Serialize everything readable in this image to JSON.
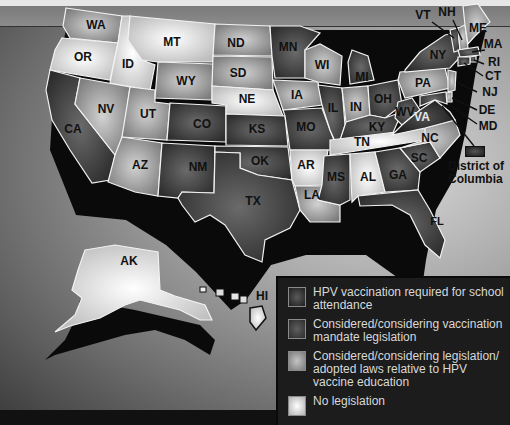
{
  "map": {
    "type": "choropleth",
    "subject": "HPV vaccination legislation status by US state",
    "colors": {
      "required": "#2a2a2a",
      "mandate_considered": "#4a4a4a",
      "education": "#a0a0a0",
      "none": "#f0f0f0",
      "border": "#f2f2f2",
      "legend_bg": "#1c1c1c"
    },
    "states": {
      "WA": "education",
      "OR": "none",
      "CA": "mandate_considered",
      "ID": "none",
      "NV": "education",
      "UT": "education",
      "AZ": "education",
      "MT": "none",
      "WY": "education",
      "CO": "mandate_considered",
      "NM": "mandate_considered",
      "ND": "education",
      "SD": "education",
      "NE": "none",
      "KS": "mandate_considered",
      "OK": "mandate_considered",
      "TX": "mandate_considered",
      "MN": "mandate_considered",
      "IA": "education",
      "MO": "mandate_considered",
      "AR": "none",
      "LA": "education",
      "WI": "education",
      "IL": "mandate_considered",
      "MI": "mandate_considered",
      "IN": "education",
      "OH": "mandate_considered",
      "KY": "mandate_considered",
      "TN": "none",
      "MS": "mandate_considered",
      "AL": "none",
      "GA": "mandate_considered",
      "FL": "mandate_considered",
      "SC": "mandate_considered",
      "NC": "education",
      "VA": "required",
      "WV": "mandate_considered",
      "PA": "education",
      "NY": "mandate_considered",
      "VT": "mandate_considered",
      "NH": "education",
      "ME": "education",
      "MA": "mandate_considered",
      "RI": "mandate_considered",
      "CT": "mandate_considered",
      "NJ": "education",
      "DE": "education",
      "MD": "mandate_considered",
      "DC": "required",
      "AK": "none",
      "HI": "none"
    },
    "labels": {
      "WA": "WA",
      "OR": "OR",
      "CA": "CA",
      "ID": "ID",
      "NV": "NV",
      "UT": "UT",
      "AZ": "AZ",
      "MT": "MT",
      "WY": "WY",
      "CO": "CO",
      "NM": "NM",
      "ND": "ND",
      "SD": "SD",
      "NE": "NE",
      "KS": "KS",
      "OK": "OK",
      "TX": "TX",
      "MN": "MN",
      "IA": "IA",
      "MO": "MO",
      "AR": "AR",
      "LA": "LA",
      "WI": "WI",
      "IL": "IL",
      "MI": "MI",
      "IN": "IN",
      "OH": "OH",
      "KY": "KY",
      "TN": "TN",
      "MS": "MS",
      "AL": "AL",
      "GA": "GA",
      "FL": "FL",
      "SC": "SC",
      "NC": "NC",
      "VA": "VA",
      "WV": "WV",
      "PA": "PA",
      "NY": "NY",
      "VT": "VT",
      "NH": "NH",
      "ME": "ME",
      "MA": "MA",
      "RI": "RI",
      "CT": "CT",
      "NJ": "NJ",
      "DE": "DE",
      "MD": "MD",
      "AK": "AK",
      "HI": "HI"
    },
    "dc_label": "District of Columbia",
    "dc_label_line1": "District of",
    "dc_label_line2": "Columbia"
  },
  "legend": {
    "items": [
      {
        "key": "required",
        "label": "HPV vaccination required for school attendance"
      },
      {
        "key": "mandate_considered",
        "label": "Considered/considering vaccination mandate legislation"
      },
      {
        "key": "education",
        "label": "Considered/considering legislation/ adopted laws relative to HPV vaccine education"
      },
      {
        "key": "none",
        "label": "No legislation"
      }
    ]
  }
}
